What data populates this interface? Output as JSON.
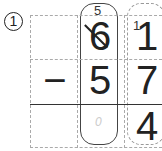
{
  "problem": {
    "number_label": "①",
    "operator": "−",
    "minuend": {
      "tens": "6",
      "ones": "1"
    },
    "subtrahend": {
      "tens": "5",
      "ones": "7"
    },
    "result": {
      "tens": "0",
      "ones": "4"
    },
    "borrow": {
      "tens_new": "5",
      "ones_carry": "1"
    }
  }
}
